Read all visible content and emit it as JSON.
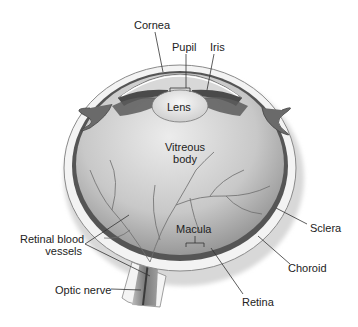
{
  "diagram": {
    "colors": {
      "background": "#ffffff",
      "sclera": "#f2f2f2",
      "choroid": "#5a5a5a",
      "vitreous_light": "#e6e6e6",
      "vitreous_dark": "#9a9a9a",
      "lens": "#ededed",
      "label_text": "#222222",
      "leader_line": "#333333"
    },
    "labels": {
      "cornea": "Cornea",
      "pupil": "Pupil",
      "iris": "Iris",
      "lens": "Lens",
      "vitreous_line1": "Vitreous",
      "vitreous_line2": "body",
      "retinal_vessels_line1": "Retinal blood",
      "retinal_vessels_line2": "vessels",
      "optic_nerve": "Optic nerve",
      "macula": "Macula",
      "sclera": "Sclera",
      "choroid": "Choroid",
      "retina": "Retina"
    }
  }
}
